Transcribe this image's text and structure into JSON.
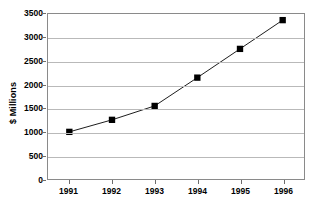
{
  "chart_data": {
    "type": "line",
    "title": "",
    "subtitle": "",
    "xlabel": "",
    "ylabel": "$ Millions",
    "categories": [
      "1991",
      "1992",
      "1993",
      "1994",
      "1995",
      "1996"
    ],
    "values": [
      1000,
      1255,
      1550,
      2150,
      2760,
      3370
    ],
    "series": [
      {
        "name": "",
        "values": [
          1000,
          1255,
          1550,
          2150,
          2760,
          3370
        ]
      }
    ],
    "ylim": [
      0,
      3500
    ],
    "y_ticks": [
      0,
      500,
      1000,
      1500,
      2000,
      2500,
      3000,
      3500
    ],
    "y_tick_labels": [
      "0",
      "500",
      "1000",
      "1500",
      "2000",
      "2500",
      "3000",
      "3500"
    ],
    "x_tick_labels": [
      "1991",
      "1992",
      "1993",
      "1994",
      "1995",
      "1996"
    ],
    "grid": true,
    "grid_axis": "y",
    "legend": false,
    "legend_position": "none",
    "marker": "square",
    "marker_color": "#000000",
    "line_color": "#1a1a1a",
    "plot_background": "#ffffff",
    "gridline_color": "#b9b9b9",
    "border_color": "#8a8a8a"
  }
}
